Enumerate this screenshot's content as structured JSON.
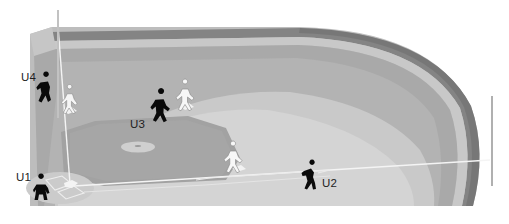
{
  "diagram": {
    "view": "Third-base side perspective of a baseball field",
    "width": 509,
    "height": 224
  },
  "palette": {
    "background": "#ffffff",
    "outfield_grass_dark": "#a8a8a8",
    "outfield_grass_mid": "#b4b4b4",
    "infield_grass_light": "#c8c8c8",
    "infield_grass_lighter": "#d2d2d2",
    "infield_dirt": "#a0a0a0",
    "foul_territory": "#bdbdbd",
    "warning_track": "#c4c4c4",
    "fence": "#848484",
    "fence_shadow": "#6e6e6e",
    "chalk_line": "#f0f0f0",
    "base_white": "#f2f2f2",
    "mound": "#cfcfcf",
    "pole": "#b0b0b0",
    "umpire_fill": "#0a0a0a",
    "fielder_fill": "#f5f5f5",
    "fielder_stroke": "#8c8c8c",
    "label_text": "#1d1d1d"
  },
  "umpires": [
    {
      "id": "U1",
      "label": "U1",
      "role": "plate-umpire",
      "label_x": 16,
      "label_y": 172,
      "figure_x": 33,
      "figure_y": 179,
      "pose": "crouching"
    },
    {
      "id": "U2",
      "label": "U2",
      "role": "first-base-line-umpire",
      "label_x": 322,
      "label_y": 178,
      "figure_x": 300,
      "figure_y": 164,
      "pose": "bent-forward"
    },
    {
      "id": "U3",
      "label": "U3",
      "role": "infield-umpire",
      "label_x": 130,
      "label_y": 119,
      "figure_x": 150,
      "figure_y": 94,
      "pose": "standing-ready"
    },
    {
      "id": "U4",
      "label": "U4",
      "role": "third-base-line-umpire",
      "label_x": 21,
      "label_y": 72,
      "figure_x": 36,
      "figure_y": 77,
      "pose": "standing-ready"
    }
  ],
  "fielders": [
    {
      "id": "F1",
      "position": "third-base",
      "x": 61,
      "y": 89
    },
    {
      "id": "F2",
      "position": "shortstop",
      "x": 176,
      "y": 84
    },
    {
      "id": "F3",
      "position": "first-base",
      "x": 224,
      "y": 146
    }
  ],
  "field_features": [
    {
      "id": "pitchers-mound",
      "label": "Pitcher's mound"
    },
    {
      "id": "home-plate",
      "label": "Home plate"
    },
    {
      "id": "infield-dirt",
      "label": "Infield dirt"
    },
    {
      "id": "outfield-fence",
      "label": "Outfield fence"
    },
    {
      "id": "warning-track",
      "label": "Warning track"
    },
    {
      "id": "right-field-foul-pole",
      "label": "Right field foul pole"
    },
    {
      "id": "left-field-foul-pole",
      "label": "Left field foul pole"
    },
    {
      "id": "first-base-foul-line",
      "label": "First base foul line"
    }
  ]
}
